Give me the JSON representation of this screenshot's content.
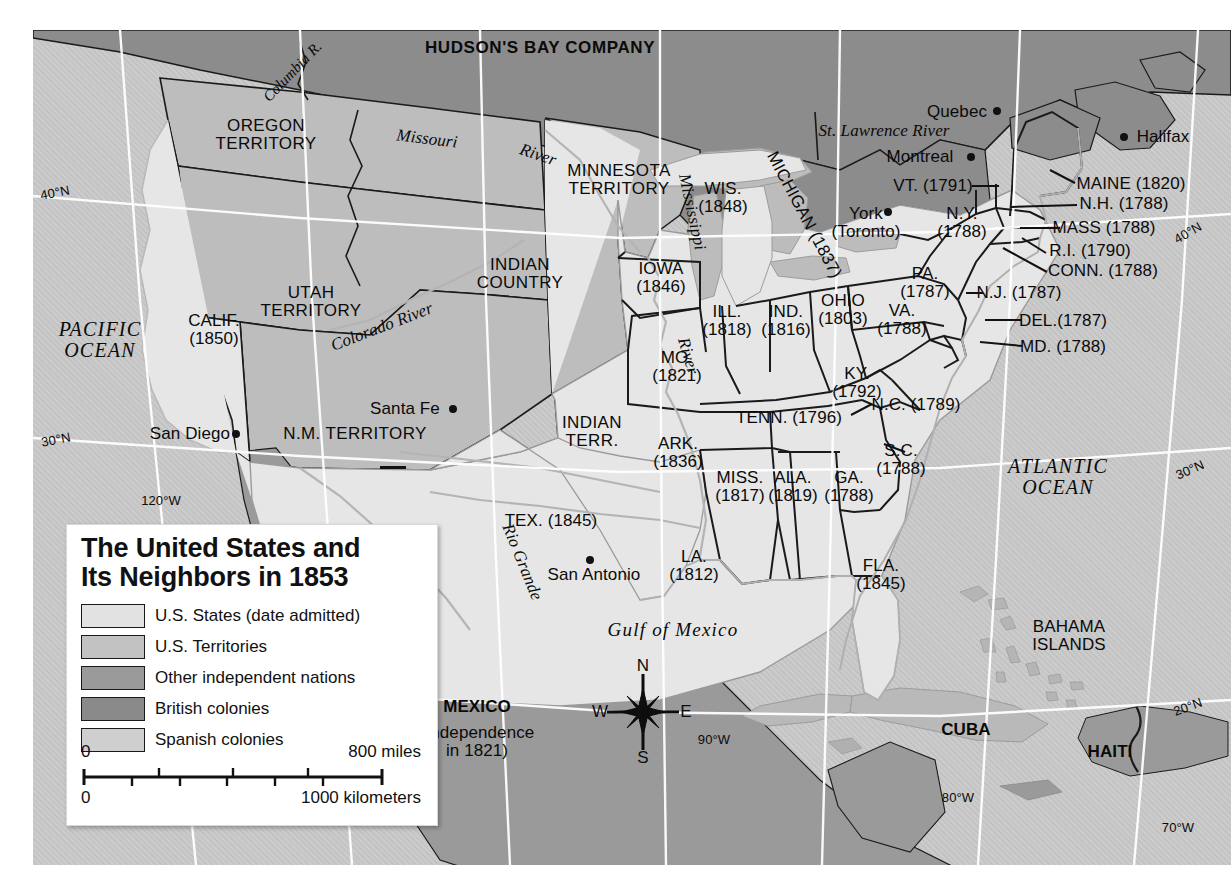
{
  "map": {
    "title_line1": "The United States and",
    "title_line2": "Its Neighbors in 1853",
    "legend": [
      {
        "label": "U.S. States (date admitted)",
        "color": "#e2e2e2"
      },
      {
        "label": "U.S. Territories",
        "color": "#c2c2c2"
      },
      {
        "label": "Other independent nations",
        "color": "#9a9a9a"
      },
      {
        "label": "British colonies",
        "color": "#8a8a8a"
      },
      {
        "label": "Spanish colonies",
        "color": "#cfcfcf"
      }
    ],
    "scale": {
      "miles_start": "0",
      "miles_end": "800 miles",
      "km_start": "0",
      "km_end": "1000 kilometers"
    },
    "compass": {
      "n": "N",
      "e": "E",
      "s": "S",
      "w": "W"
    },
    "regions": {
      "hudson_bay": "HUDSON'S BAY COMPANY",
      "oregon": "OREGON\nTERRITORY",
      "minnesota": "MINNESOTA\nTERRITORY",
      "indian_country": "INDIAN\nCOUNTRY",
      "utah": "UTAH\nTERRITORY",
      "nm": "N.M. TERRITORY",
      "indian_terr": "INDIAN\nTERR.",
      "mexico": "MEXICO",
      "mexico_sub": "(Independence\nin 1821)",
      "cuba": "CUBA",
      "haiti": "HAITI",
      "bahamas": "BAHAMA\nISLANDS"
    },
    "states": [
      {
        "name": "CALIF.",
        "year": "(1850)"
      },
      {
        "name": "IOWA",
        "year": "(1846)"
      },
      {
        "name": "WIS.",
        "year": "(1848)"
      },
      {
        "name": "MICHIGAN",
        "year": "(1837)"
      },
      {
        "name": "ILL.",
        "year": "(1818)"
      },
      {
        "name": "IND.",
        "year": "(1816)"
      },
      {
        "name": "OHIO",
        "year": "(1803)"
      },
      {
        "name": "MO.",
        "year": "(1821)"
      },
      {
        "name": "ARK.",
        "year": "(1836)"
      },
      {
        "name": "KY.",
        "year": "(1792)"
      },
      {
        "name": "TENN.",
        "year": "(1796)"
      },
      {
        "name": "MISS.",
        "year": "(1817)"
      },
      {
        "name": "ALA.",
        "year": "(1819)"
      },
      {
        "name": "GA.",
        "year": "(1788)"
      },
      {
        "name": "S.C.",
        "year": "(1788)"
      },
      {
        "name": "N.C.",
        "year": "(1789)"
      },
      {
        "name": "VA.",
        "year": "(1788)"
      },
      {
        "name": "PA.",
        "year": "(1787)"
      },
      {
        "name": "N.Y.",
        "year": "(1788)"
      },
      {
        "name": "VT.",
        "year": "(1791)"
      },
      {
        "name": "MAINE",
        "year": "(1820)"
      },
      {
        "name": "N.H.",
        "year": "(1788)"
      },
      {
        "name": "MASS",
        "year": "(1788)"
      },
      {
        "name": "R.I.",
        "year": "(1790)"
      },
      {
        "name": "CONN.",
        "year": "(1788)"
      },
      {
        "name": "N.J.",
        "year": "(1787)"
      },
      {
        "name": "DEL.",
        "year": "(1787)"
      },
      {
        "name": "MD.",
        "year": "(1788)"
      },
      {
        "name": "LA.",
        "year": "(1812)"
      },
      {
        "name": "FLA.",
        "year": "(1845)"
      },
      {
        "name": "TEX.",
        "year": "(1845)"
      }
    ],
    "state_labels": {
      "calif": "CALIF.\n(1850)",
      "iowa": "IOWA\n(1846)",
      "wis": "WIS.\n(1848)",
      "michigan": "MICHIGAN (1837)",
      "ill": "ILL.\n(1818)",
      "ind": "IND.\n(1816)",
      "ohio": "OHIO\n(1803)",
      "mo": "MO.\n(1821)",
      "ark": "ARK.\n(1836)",
      "ky": "KY.\n(1792)",
      "tenn": "TENN. (1796)",
      "miss": "MISS.\n(1817)",
      "ala": "ALA.\n(1819)",
      "ga": "GA.\n(1788)",
      "sc": "S.C.\n(1788)",
      "nc": "N.C. (1789)",
      "va": "VA.\n(1788)",
      "pa": "PA.\n(1787)",
      "ny": "N.Y.\n(1788)",
      "vt": "VT. (1791)",
      "maine": "MAINE (1820)",
      "nh": "N.H. (1788)",
      "mass": "MASS (1788)",
      "ri": "R.I. (1790)",
      "conn": "CONN. (1788)",
      "nj": "N.J. (1787)",
      "del": "DEL.(1787)",
      "md": "MD. (1788)",
      "la": "LA.\n(1812)",
      "fla": "FLA.\n(1845)",
      "tex": "TEX. (1845)"
    },
    "cities": [
      {
        "name": "Quebec"
      },
      {
        "name": "Montreal"
      },
      {
        "name": "Halifax"
      },
      {
        "name": "York\n(Toronto)"
      },
      {
        "name": "Santa Fe"
      },
      {
        "name": "San Diego"
      },
      {
        "name": "San Antonio"
      }
    ],
    "city_labels": {
      "quebec": "Quebec",
      "montreal": "Montreal",
      "halifax": "Halifax",
      "york": "York\n(Toronto)",
      "santafe": "Santa Fe",
      "sandiego": "San Diego",
      "sanantonio": "San Antonio"
    },
    "water": {
      "pacific": "PACIFIC\nOCEAN",
      "atlantic": "ATLANTIC\nOCEAN",
      "gulf": "Gulf of Mexico",
      "columbia": "Columbia R.",
      "missouri": "Missouri",
      "missouri_river": "River",
      "mississippi": "Mississippi",
      "mississippi_river": "River",
      "colorado": "Colorado River",
      "rio_grande": "Rio Grande",
      "st_lawrence": "St. Lawrence River"
    },
    "graticule": {
      "lat40_w": "40°N",
      "lat30_w": "30°N",
      "lat40_e": "40°N",
      "lat30_e": "30°N",
      "lat20_e": "20°N",
      "lon120": "120°W",
      "lon90": "90°W",
      "lon80": "80°W",
      "lon70": "70°W"
    }
  }
}
